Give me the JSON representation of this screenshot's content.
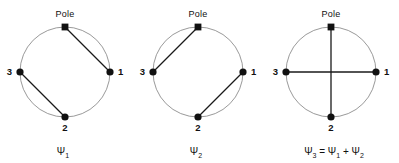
{
  "figure": {
    "background_color": "#ffffff",
    "circle_color": "#9a9a9a",
    "chord_color": "#1a1a1a",
    "node_color": "#111111",
    "geometry": {
      "circle_radius": 45,
      "center_y": 72,
      "node_angles_deg": {
        "pole": 90,
        "right": 0,
        "left": 180,
        "bottom": 270
      }
    }
  },
  "panels": [
    {
      "id": "psi-1",
      "center_x": 65,
      "pole_label": "Pole",
      "nodes": [
        {
          "name": "pole",
          "label": "",
          "x": 65,
          "y": 27,
          "marker": "square"
        },
        {
          "name": "right",
          "label": "1",
          "x": 110,
          "y": 72,
          "marker": "dot"
        },
        {
          "name": "bottom",
          "label": "2",
          "x": 65,
          "y": 117,
          "marker": "dot"
        },
        {
          "name": "left",
          "label": "3",
          "x": 20,
          "y": 72,
          "marker": "dot"
        }
      ],
      "chords": [
        {
          "from": "pole",
          "to": "right"
        },
        {
          "from": "left",
          "to": "bottom"
        }
      ],
      "caption": "Ψ",
      "caption_sub": "1",
      "caption_full": "Ψ₁"
    },
    {
      "id": "psi-2",
      "center_x": 198,
      "pole_label": "Pole",
      "nodes": [
        {
          "name": "pole",
          "label": "",
          "x": 198,
          "y": 27,
          "marker": "square"
        },
        {
          "name": "right",
          "label": "1",
          "x": 243,
          "y": 72,
          "marker": "dot"
        },
        {
          "name": "bottom",
          "label": "2",
          "x": 198,
          "y": 117,
          "marker": "dot"
        },
        {
          "name": "left",
          "label": "3",
          "x": 153,
          "y": 72,
          "marker": "dot"
        }
      ],
      "chords": [
        {
          "from": "pole",
          "to": "left"
        },
        {
          "from": "right",
          "to": "bottom"
        }
      ],
      "caption": "Ψ",
      "caption_sub": "2",
      "caption_full": "Ψ₂"
    },
    {
      "id": "psi-3",
      "center_x": 331,
      "pole_label": "Pole",
      "nodes": [
        {
          "name": "pole",
          "label": "",
          "x": 331,
          "y": 27,
          "marker": "square"
        },
        {
          "name": "right",
          "label": "1",
          "x": 376,
          "y": 72,
          "marker": "dot"
        },
        {
          "name": "bottom",
          "label": "2",
          "x": 331,
          "y": 117,
          "marker": "dot"
        },
        {
          "name": "left",
          "label": "3",
          "x": 286,
          "y": 72,
          "marker": "dot"
        }
      ],
      "chords": [
        {
          "from": "pole",
          "to": "bottom"
        },
        {
          "from": "left",
          "to": "right"
        }
      ],
      "caption": "Ψ",
      "caption_sub": "3",
      "caption_equation": " = Ψ",
      "caption_eq_sub1": "1",
      "caption_plus": " + Ψ",
      "caption_eq_sub2": "2",
      "caption_full": "Ψ₃ = Ψ₁ + Ψ₂"
    }
  ]
}
